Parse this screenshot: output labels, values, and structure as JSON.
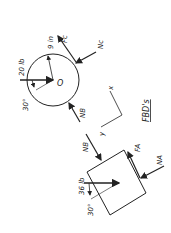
{
  "title": "FBD's",
  "disk": {
    "center_label": "O",
    "weight_label": "20 lb",
    "angle_label": "30°",
    "radius_label": "9 in",
    "forces": [
      "Fc",
      "Nc",
      "NB"
    ]
  },
  "block": {
    "weight_label": "36 lb",
    "angle_label": "30°",
    "forces": [
      "NB",
      "FA",
      "NA"
    ]
  },
  "axes": {
    "x_label": "x",
    "y_label": "y"
  },
  "colors": {
    "ink": "#222222",
    "background": "#ffffff"
  }
}
